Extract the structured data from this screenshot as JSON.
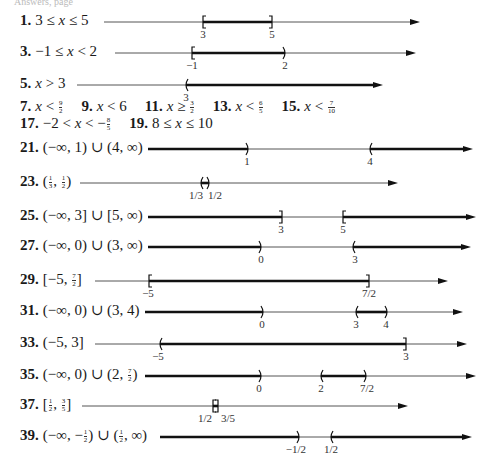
{
  "top_fragment": "Answers, page",
  "problems": [
    {
      "number": "1.",
      "label": "3 ≤ x ≤ 5",
      "y": 22,
      "label_x": 20,
      "line_start": 104,
      "line_end": 420,
      "segments": [
        {
          "from": 203,
          "to": 272
        }
      ],
      "marks": [
        {
          "x": 203,
          "type": "["
        },
        {
          "x": 272,
          "type": "]"
        }
      ],
      "ticks": [
        {
          "x": 203,
          "text": "3"
        },
        {
          "x": 272,
          "text": "5"
        }
      ]
    },
    {
      "number": "3.",
      "label": "−1 ≤ x < 2",
      "y": 53,
      "label_x": 20,
      "line_start": 115,
      "line_end": 416,
      "segments": [
        {
          "from": 192,
          "to": 285
        }
      ],
      "marks": [
        {
          "x": 192,
          "type": "["
        },
        {
          "x": 285,
          "type": ")"
        }
      ],
      "ticks": [
        {
          "x": 192,
          "text": "−1"
        },
        {
          "x": 285,
          "text": "2"
        }
      ]
    },
    {
      "number": "5.",
      "label": "x > 3",
      "y": 85,
      "label_x": 20,
      "line_start": 77,
      "line_end": 383,
      "segments": [
        {
          "from": 186,
          "to": 376
        }
      ],
      "marks": [
        {
          "x": 186,
          "type": "("
        }
      ],
      "ticks": [
        {
          "x": 186,
          "text": "3"
        }
      ]
    },
    {
      "number": "21.",
      "label": "(−∞, 1) ∪ (4, ∞)",
      "y": 149,
      "label_x": 20,
      "line_start": 148,
      "line_end": 473,
      "segments": [
        {
          "from": 148,
          "to": 248
        },
        {
          "from": 370,
          "to": 466
        }
      ],
      "marks": [
        {
          "x": 248,
          "type": ")"
        },
        {
          "x": 370,
          "type": "("
        }
      ],
      "ticks": [
        {
          "x": 247,
          "text": "1"
        },
        {
          "x": 370,
          "text": "4"
        }
      ]
    },
    {
      "number": "23.",
      "label": "(1/3, 1/2)",
      "y": 183,
      "label_x": 20,
      "line_start": 80,
      "line_end": 398,
      "segments": [
        {
          "from": 201,
          "to": 209
        }
      ],
      "marks": [
        {
          "x": 201,
          "type": "("
        },
        {
          "x": 209,
          "type": ")"
        }
      ],
      "ticks": [
        {
          "x": 196,
          "text": "1/3"
        },
        {
          "x": 215,
          "text": "1/2"
        }
      ]
    },
    {
      "number": "25.",
      "label": "(−∞, 3] ∪ [5, ∞)",
      "y": 217,
      "label_x": 20,
      "line_start": 148,
      "line_end": 476,
      "segments": [
        {
          "from": 148,
          "to": 282
        },
        {
          "from": 343,
          "to": 469
        }
      ],
      "marks": [
        {
          "x": 282,
          "type": "]"
        },
        {
          "x": 343,
          "type": "["
        }
      ],
      "ticks": [
        {
          "x": 281,
          "text": "3"
        },
        {
          "x": 343,
          "text": "5"
        }
      ]
    },
    {
      "number": "27.",
      "label": "(−∞, 0) ∪ (3, ∞)",
      "y": 247,
      "label_x": 20,
      "line_start": 148,
      "line_end": 471,
      "segments": [
        {
          "from": 148,
          "to": 261
        },
        {
          "from": 353,
          "to": 464
        }
      ],
      "marks": [
        {
          "x": 261,
          "type": ")"
        },
        {
          "x": 353,
          "type": "("
        }
      ],
      "ticks": [
        {
          "x": 261,
          "text": "0"
        },
        {
          "x": 355,
          "text": "3"
        }
      ]
    },
    {
      "number": "29.",
      "label": "[−5, 7/2]",
      "y": 281,
      "label_x": 20,
      "line_start": 95,
      "line_end": 448,
      "segments": [
        {
          "from": 149,
          "to": 369
        }
      ],
      "marks": [
        {
          "x": 149,
          "type": "["
        },
        {
          "x": 369,
          "type": "]"
        }
      ],
      "ticks": [
        {
          "x": 148,
          "text": "−5"
        },
        {
          "x": 369,
          "text": "7/2"
        }
      ]
    },
    {
      "number": "31.",
      "label": "(−∞, 0) ∪ (3, 4)",
      "y": 312,
      "label_x": 20,
      "line_start": 145,
      "line_end": 463,
      "segments": [
        {
          "from": 145,
          "to": 263
        },
        {
          "from": 356,
          "to": 387
        }
      ],
      "marks": [
        {
          "x": 263,
          "type": ")"
        },
        {
          "x": 356,
          "type": "("
        },
        {
          "x": 387,
          "type": ")"
        }
      ],
      "ticks": [
        {
          "x": 262,
          "text": "0"
        },
        {
          "x": 356,
          "text": "3"
        },
        {
          "x": 386,
          "text": "4"
        }
      ]
    },
    {
      "number": "33.",
      "label": "(−5, 3]",
      "y": 344,
      "label_x": 20,
      "line_start": 95,
      "line_end": 467,
      "segments": [
        {
          "from": 160,
          "to": 406
        }
      ],
      "marks": [
        {
          "x": 160,
          "type": "("
        },
        {
          "x": 406,
          "type": "]"
        }
      ],
      "ticks": [
        {
          "x": 158,
          "text": "−5"
        },
        {
          "x": 406,
          "text": "3"
        }
      ]
    },
    {
      "number": "35.",
      "label": "(−∞, 0) ∪ (2, 7/2)",
      "y": 376,
      "label_x": 20,
      "line_start": 145,
      "line_end": 476,
      "segments": [
        {
          "from": 145,
          "to": 261
        },
        {
          "from": 321,
          "to": 366
        }
      ],
      "marks": [
        {
          "x": 261,
          "type": ")"
        },
        {
          "x": 321,
          "type": "("
        },
        {
          "x": 366,
          "type": ")"
        }
      ],
      "ticks": [
        {
          "x": 259,
          "text": "0"
        },
        {
          "x": 321,
          "text": "2"
        },
        {
          "x": 367,
          "text": "7/2"
        }
      ]
    },
    {
      "number": "37.",
      "label": "[1/2, 3/5]",
      "y": 406,
      "label_x": 20,
      "line_start": 82,
      "line_end": 408,
      "segments": [
        {
          "from": 213,
          "to": 218
        }
      ],
      "marks": [
        {
          "x": 213,
          "type": "["
        },
        {
          "x": 218,
          "type": "]"
        }
      ],
      "ticks": [
        {
          "x": 205,
          "text": "1/2"
        },
        {
          "x": 228,
          "text": "3/5"
        }
      ]
    },
    {
      "number": "39.",
      "label": "(−∞, −1/2) ∪ (1/2, ∞)",
      "y": 437,
      "label_x": 20,
      "line_start": 160,
      "line_end": 472,
      "segments": [
        {
          "from": 160,
          "to": 299
        },
        {
          "from": 331,
          "to": 465
        }
      ],
      "marks": [
        {
          "x": 299,
          "type": ")"
        },
        {
          "x": 331,
          "type": "("
        }
      ],
      "ticks": [
        {
          "x": 296,
          "text": "−1/2"
        },
        {
          "x": 331,
          "text": "1/2"
        }
      ]
    }
  ],
  "inline_rows": [
    {
      "y": 108,
      "items": [
        {
          "number": "7.",
          "text": "x < 9/2"
        },
        {
          "number": "9.",
          "text": "x < 6"
        },
        {
          "number": "11.",
          "text": "x ≥ 3/2"
        },
        {
          "number": "13.",
          "text": "x < 6/5"
        },
        {
          "number": "15.",
          "text": "x < 7/10"
        }
      ]
    },
    {
      "y": 125,
      "items": [
        {
          "number": "17.",
          "text": "−2 < x < −8/5"
        },
        {
          "number": "19.",
          "text": "8 ≤ x ≤ 10"
        }
      ]
    }
  ],
  "colors": {
    "thin_line": "#555555",
    "thick_line": "#111111",
    "text": "#1a1a1a"
  }
}
